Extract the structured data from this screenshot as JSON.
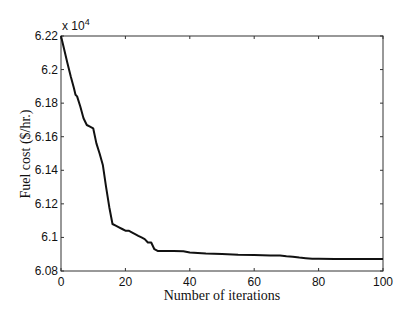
{
  "chart_data": {
    "type": "line",
    "title": "",
    "xlabel": "Number of iterations",
    "ylabel": "Fuel cost ($/hr.)",
    "y_multiplier_label": "x 10",
    "y_multiplier_exponent": "4",
    "xlim": [
      0,
      100
    ],
    "ylim": [
      6.08,
      6.22
    ],
    "xticks": [
      0,
      20,
      40,
      60,
      80,
      100
    ],
    "xtick_labels": [
      "0",
      "20",
      "40",
      "60",
      "80",
      "100"
    ],
    "yticks": [
      6.08,
      6.1,
      6.12,
      6.14,
      6.16,
      6.18,
      6.2,
      6.22
    ],
    "ytick_labels": [
      "6.08",
      "6.1",
      "6.12",
      "6.14",
      "6.16",
      "6.18",
      "6.2",
      "6.22"
    ],
    "grid": false,
    "legend": null,
    "series": [
      {
        "name": "Fuel cost",
        "color": "#111111",
        "x": [
          0,
          1,
          2,
          3,
          4,
          4.5,
          5,
          6,
          7,
          8,
          9,
          10,
          11,
          12,
          13,
          14,
          15,
          16,
          17,
          18,
          19,
          20,
          21,
          22,
          23,
          24,
          25,
          26,
          27,
          28,
          29,
          30,
          35,
          38,
          40,
          45,
          50,
          55,
          60,
          65,
          68,
          70,
          72,
          74,
          76,
          78,
          80,
          85,
          90,
          95,
          100
        ],
        "values": [
          6.22,
          6.212,
          6.204,
          6.196,
          6.189,
          6.185,
          6.184,
          6.178,
          6.171,
          6.167,
          6.166,
          6.165,
          6.156,
          6.15,
          6.143,
          6.13,
          6.118,
          6.108,
          6.107,
          6.106,
          6.105,
          6.104,
          6.104,
          6.103,
          6.102,
          6.101,
          6.1,
          6.099,
          6.097,
          6.097,
          6.093,
          6.092,
          6.092,
          6.0918,
          6.091,
          6.0905,
          6.0902,
          6.0897,
          6.0895,
          6.0893,
          6.0893,
          6.0888,
          6.0885,
          6.088,
          6.0876,
          6.0873,
          6.0873,
          6.0872,
          6.0872,
          6.0871,
          6.0871
        ]
      }
    ]
  }
}
